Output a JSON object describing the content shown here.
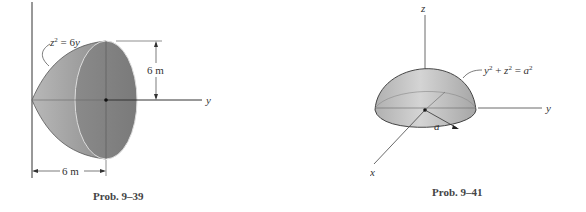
{
  "figures": [
    {
      "caption": "Prob. 9–39",
      "curve_label": "z² = 6y",
      "curve_label_base": "z",
      "curve_label_rest": " = 6y",
      "height_dimension": "6 m",
      "length_dimension": "6 m",
      "axis_y": "y",
      "shape": "paraboloid"
    },
    {
      "caption": "Prob. 9–41",
      "surface_label": "y² + z² = a²",
      "axis_x": "x",
      "axis_y": "y",
      "axis_z": "z",
      "radius_label": "a",
      "shape": "hemisphere"
    }
  ],
  "colors": {
    "solid_fill_dark": "#8c8c8c",
    "solid_fill_light": "#c8c8c8",
    "line": "#333333"
  }
}
